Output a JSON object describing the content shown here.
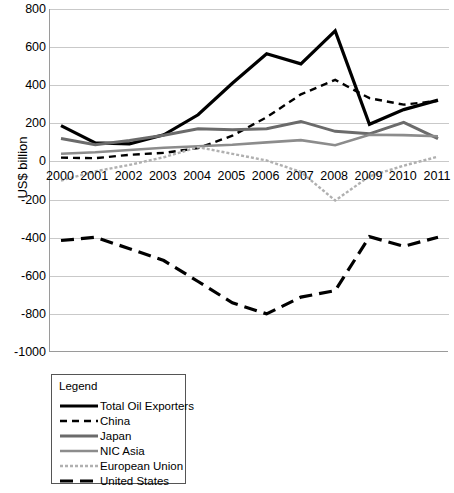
{
  "chart_data": {
    "type": "line",
    "title": "",
    "xlabel": "",
    "ylabel": "US$ billion",
    "ylim": [
      -1000,
      800
    ],
    "ytick_step": 200,
    "grid": true,
    "legend_position": "below-left",
    "legend_title": "Legend",
    "categories": [
      "2000",
      "2001",
      "2002",
      "2003",
      "2004",
      "2005",
      "2006",
      "2007",
      "2008",
      "2009",
      "2010",
      "2011"
    ],
    "x": [
      2000,
      2001,
      2002,
      2003,
      2004,
      2005,
      2006,
      2007,
      2008,
      2009,
      2010,
      2011
    ],
    "yticks": [
      800,
      600,
      400,
      200,
      0,
      -200,
      -400,
      -600,
      -800,
      -1000
    ],
    "ytick_labels": [
      "800",
      "600",
      "400",
      "200",
      "0",
      "-200",
      "-400",
      "-600",
      "-800",
      "-1000"
    ],
    "series": [
      {
        "name": "Total Oil Exporters",
        "color": "#000000",
        "style": "solid",
        "width": 3.2,
        "values": [
          188,
          97,
          92,
          140,
          245,
          410,
          565,
          512,
          685,
          195,
          272,
          322
        ]
      },
      {
        "name": "China",
        "color": "#000000",
        "style": "dashed",
        "width": 2.4,
        "values": [
          20,
          17,
          35,
          45,
          70,
          135,
          232,
          352,
          428,
          332,
          298,
          318
        ]
      },
      {
        "name": "Japan",
        "color": "#6b6b6b",
        "style": "solid",
        "width": 3.0,
        "values": [
          120,
          88,
          110,
          138,
          172,
          166,
          172,
          210,
          158,
          145,
          205,
          120
        ]
      },
      {
        "name": "NIC Asia",
        "color": "#8c8c8c",
        "style": "solid",
        "width": 2.6,
        "values": [
          40,
          48,
          60,
          72,
          80,
          88,
          100,
          112,
          85,
          140,
          138,
          132
        ]
      },
      {
        "name": "European Union",
        "color": "#b0b0b0",
        "style": "dotted",
        "width": 2.4,
        "values": [
          -100,
          -52,
          -18,
          22,
          75,
          40,
          5,
          -55,
          -205,
          -78,
          -22,
          25
        ]
      },
      {
        "name": "United States",
        "color": "#000000",
        "style": "longdash",
        "width": 3.2,
        "values": [
          -415,
          -398,
          -458,
          -520,
          -630,
          -742,
          -800,
          -712,
          -678,
          -395,
          -445,
          -398
        ]
      }
    ]
  },
  "legend": {
    "title": "Legend",
    "items": [
      {
        "label": "Total Oil Exporters"
      },
      {
        "label": "China"
      },
      {
        "label": "Japan"
      },
      {
        "label": "NIC Asia"
      },
      {
        "label": "European Union"
      },
      {
        "label": "United States"
      }
    ]
  },
  "axes": {
    "y_title": "US$ billion"
  }
}
